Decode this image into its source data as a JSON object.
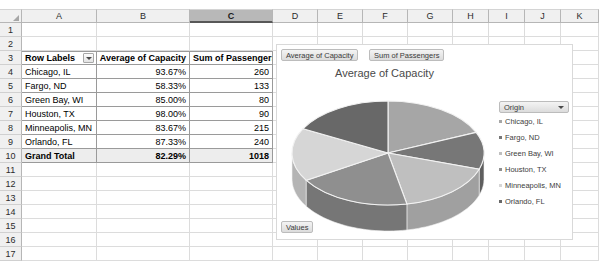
{
  "grid": {
    "columns": [
      "A",
      "B",
      "C",
      "D",
      "E",
      "F",
      "G",
      "H",
      "I",
      "J",
      "K"
    ],
    "active_column": "C",
    "rows": [
      "1",
      "2",
      "3",
      "4",
      "5",
      "6",
      "7",
      "8",
      "9",
      "10",
      "11",
      "12",
      "13",
      "14",
      "15",
      "16",
      "17"
    ]
  },
  "pivot": {
    "headers": [
      "Row Labels",
      "Average of Capacity",
      "Sum of Passengers"
    ],
    "filter_icon": "chevron-down-icon",
    "rows": [
      {
        "label": "Chicago, IL",
        "capacity": "93.67%",
        "passengers": "260"
      },
      {
        "label": "Fargo, ND",
        "capacity": "58.33%",
        "passengers": "133"
      },
      {
        "label": "Green Bay, WI",
        "capacity": "85.00%",
        "passengers": "80"
      },
      {
        "label": "Houston, TX",
        "capacity": "98.00%",
        "passengers": "90"
      },
      {
        "label": "Minneapolis, MN",
        "capacity": "83.67%",
        "passengers": "215"
      },
      {
        "label": "Orlando, FL",
        "capacity": "87.33%",
        "passengers": "240"
      }
    ],
    "total": {
      "label": "Grand Total",
      "capacity": "82.29%",
      "passengers": "1018"
    }
  },
  "chart": {
    "field_buttons": [
      "Average of Capacity",
      "Sum of Passengers"
    ],
    "values_button": "Values",
    "legend_title": "Origin",
    "legend_caret": "chevron-down-icon"
  },
  "chart_data": {
    "type": "pie",
    "title": "Average of Capacity",
    "xlabel": "",
    "ylabel": "",
    "legend_position": "right",
    "three_d": true,
    "categories": [
      "Chicago, IL",
      "Fargo, ND",
      "Green Bay, WI",
      "Houston, TX",
      "Minneapolis, MN",
      "Orlando, FL"
    ],
    "values": [
      93.67,
      58.33,
      85.0,
      98.0,
      83.67,
      87.33
    ],
    "value_unit": "%",
    "percentages": [
      18.97,
      11.81,
      17.21,
      19.85,
      16.94,
      17.68
    ],
    "colors": [
      "#a6a6a6",
      "#777777",
      "#bfbfbf",
      "#8f8f8f",
      "#d6d6d6",
      "#686868"
    ],
    "side_colors": [
      "#8a8a8a",
      "#5e5e5e",
      "#a0a0a0",
      "#767676",
      "#b4b4b4",
      "#505050"
    ]
  }
}
